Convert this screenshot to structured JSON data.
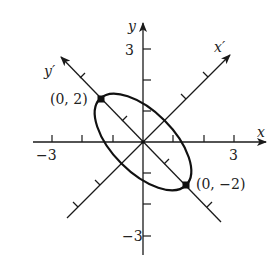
{
  "figure": {
    "type": "rotated-ellipse-diagram",
    "axes": {
      "x": {
        "label": "x",
        "tick_labels": {
          "neg": "−3",
          "pos": "3"
        },
        "range": [
          -3.5,
          4
        ]
      },
      "y": {
        "label": "y",
        "tick_labels": {
          "neg": "−3",
          "pos": "3"
        },
        "range": [
          -3.7,
          3.9
        ]
      },
      "x_prime": {
        "label": "x′",
        "rotation_deg": 45
      },
      "y_prime": {
        "label": "y′",
        "rotation_deg": 135
      }
    },
    "ellipse": {
      "center": [
        0,
        0
      ],
      "semi_major": 2,
      "semi_minor": 1,
      "major_axis": "y′",
      "rotation_deg": 45
    },
    "points": [
      {
        "label": "(0, 2)",
        "frame": "x′y′"
      },
      {
        "label": "(0, −2)",
        "frame": "x′y′"
      }
    ]
  }
}
